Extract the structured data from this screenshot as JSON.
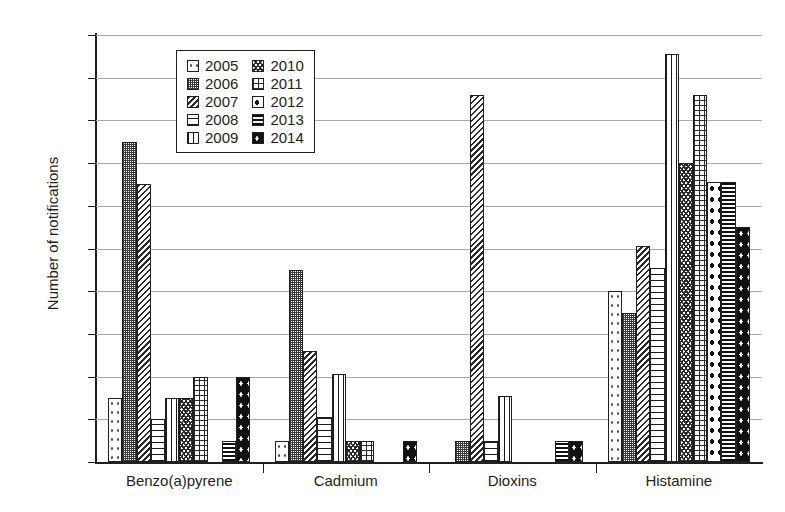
{
  "chart_data": {
    "type": "bar",
    "title": "",
    "subtitle": "",
    "xlabel": "",
    "ylabel": "Number of notifications",
    "ylim": [
      0,
      20
    ],
    "ytick_step": 2,
    "yticks": [
      0,
      2,
      4,
      6,
      8,
      10,
      12,
      14,
      16,
      18,
      20
    ],
    "grid": true,
    "legend_position": "top-center-inside",
    "categories": [
      "Benzo(a)pyrene",
      "Cadmium",
      "Dioxins",
      "Histamine"
    ],
    "series": [
      {
        "name": "2005",
        "pattern": "sparse-dots",
        "values": [
          3,
          1,
          0,
          8
        ]
      },
      {
        "name": "2006",
        "pattern": "fine-checker",
        "values": [
          15,
          9,
          1,
          7
        ]
      },
      {
        "name": "2007",
        "pattern": "diagonal-hatch",
        "values": [
          13,
          5.2,
          17.2,
          10.1
        ]
      },
      {
        "name": "2008",
        "pattern": "horizontal-lines",
        "values": [
          2,
          2.1,
          1,
          9.1
        ]
      },
      {
        "name": "2009",
        "pattern": "vertical-lines",
        "values": [
          3,
          4.1,
          3.1,
          19.1
        ]
      },
      {
        "name": "2010",
        "pattern": "wave-crosshatch",
        "values": [
          3,
          1,
          0,
          14
        ]
      },
      {
        "name": "2011",
        "pattern": "open-grid",
        "values": [
          4,
          1,
          0,
          17.2
        ]
      },
      {
        "name": "2012",
        "pattern": "large-dots",
        "values": [
          0,
          0,
          0,
          13.1
        ]
      },
      {
        "name": "2013",
        "pattern": "dense-horizontal",
        "values": [
          1,
          0,
          1,
          13.1
        ]
      },
      {
        "name": "2014",
        "pattern": "black-dots",
        "values": [
          4,
          1,
          1,
          11
        ]
      }
    ]
  },
  "axis": {
    "y_title": "Number of notifications",
    "y_tick_labels": [
      "20",
      "18",
      "16",
      "14",
      "12",
      "10",
      "8",
      "6",
      "4",
      "2",
      "0"
    ],
    "x_tick_labels": [
      "Benzo(a)pyrene",
      "Cadmium",
      "Dioxins",
      "Histamine"
    ]
  },
  "legend": {
    "column_left": [
      {
        "label": "2005",
        "pattern": "sparse-dots"
      },
      {
        "label": "2006",
        "pattern": "fine-checker"
      },
      {
        "label": "2007",
        "pattern": "diagonal-hatch"
      },
      {
        "label": "2008",
        "pattern": "horizontal-lines"
      },
      {
        "label": "2009",
        "pattern": "vertical-lines"
      }
    ],
    "column_right": [
      {
        "label": "2010",
        "pattern": "wave-crosshatch"
      },
      {
        "label": "2011",
        "pattern": "open-grid"
      },
      {
        "label": "2012",
        "pattern": "large-dots"
      },
      {
        "label": "2013",
        "pattern": "dense-horizontal"
      },
      {
        "label": "2014",
        "pattern": "black-dots"
      }
    ]
  },
  "colors": {
    "background": "#ffffff",
    "ink": "#231f20",
    "gridline": "#a7a9ac"
  }
}
